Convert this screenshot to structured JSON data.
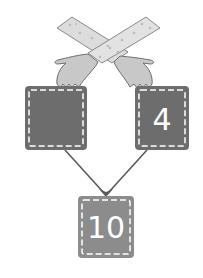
{
  "diagram": {
    "title": "",
    "colors": {
      "box_fill": "#6d6d6d",
      "box_bottom_fill": "#8c8c8c",
      "stitch": "#ffffff",
      "arrow": "#5a5a5a",
      "sleeve": "#dcdcdc",
      "sleeve_dots": "#bdbdbd",
      "hand": "#c8c8c8",
      "outline": "#666666"
    },
    "boxes": {
      "left": {
        "value": ""
      },
      "right": {
        "value": "4"
      },
      "bottom": {
        "value": "10"
      }
    },
    "icons": {
      "hands": "crossed-hands-icon"
    }
  }
}
